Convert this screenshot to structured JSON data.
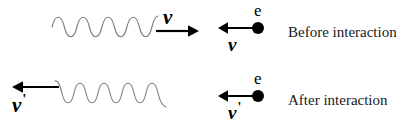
{
  "diagram": {
    "background_color": "#ffffff",
    "ink_color": "#000000",
    "wave_color": "#7a7a7a"
  },
  "rows": [
    {
      "id": "before",
      "caption": "Before interaction",
      "photon": {
        "symbol": "ν",
        "prime": "",
        "direction": "right",
        "cycles": 4.5,
        "label_position": "above-arrow-right"
      },
      "electron": {
        "symbol": "e",
        "velocity_symbol": "v",
        "velocity_prime": "",
        "direction": "left"
      }
    },
    {
      "id": "after",
      "caption": "After interaction",
      "photon": {
        "symbol": "ν",
        "prime": "'",
        "direction": "left",
        "cycles": 4.0,
        "label_position": "below-arrow-left"
      },
      "electron": {
        "symbol": "e",
        "velocity_symbol": "v",
        "velocity_prime": "'",
        "direction": "left"
      }
    }
  ]
}
